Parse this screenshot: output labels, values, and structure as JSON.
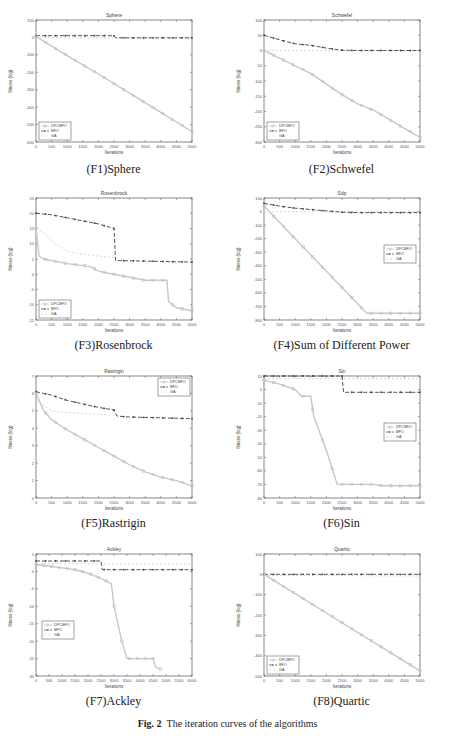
{
  "figure_caption": {
    "label": "Fig. 2",
    "text": "The iteration curves of the algorithms"
  },
  "legend_entries": [
    "DPCBFO",
    "BFO",
    "GA"
  ],
  "series_colors": {
    "DPCBFO": "#c8c8c8",
    "BFO": "#555555",
    "GA": "#d8d8d8"
  },
  "chart_data": [
    {
      "id": "F1",
      "caption": "(F1)Sphere",
      "type": "line",
      "title": "Sphere",
      "xlabel": "Iterations",
      "ylabel": "fitness (log)",
      "xlim": [
        0,
        5000
      ],
      "ylim": [
        -600,
        100
      ],
      "xticks": [
        0,
        500,
        1000,
        1500,
        2000,
        2500,
        3000,
        3500,
        4000,
        4500,
        5000
      ],
      "yticks": [
        -600,
        -500,
        -400,
        -300,
        -200,
        -100,
        0,
        100
      ],
      "legend_position": "lower-left",
      "series": [
        {
          "name": "DPCBFO",
          "x": [
            0,
            1000,
            2000,
            3000,
            4000,
            5000
          ],
          "values": [
            5,
            -105,
            -210,
            -320,
            -430,
            -540
          ]
        },
        {
          "name": "BFO",
          "x": [
            0,
            2500,
            2550,
            5000
          ],
          "values": [
            10,
            10,
            -2,
            -2
          ]
        },
        {
          "name": "GA",
          "x": [
            0,
            1000,
            2000,
            3000,
            4000,
            5000
          ],
          "values": [
            2,
            -2,
            -3,
            -4,
            -5,
            -6
          ]
        }
      ]
    },
    {
      "id": "F2",
      "caption": "(F2)Schwefel",
      "type": "line",
      "title": "Schwefel",
      "xlabel": "Iterations",
      "ylabel": "fitness (log)",
      "xlim": [
        0,
        5000
      ],
      "ylim": [
        -300,
        100
      ],
      "xticks": [
        0,
        500,
        1000,
        1500,
        2000,
        2500,
        3000,
        3500,
        4000,
        4500,
        5000
      ],
      "yticks": [
        -300,
        -250,
        -200,
        -150,
        -100,
        -50,
        0,
        50,
        100
      ],
      "legend_position": "lower-left",
      "series": [
        {
          "name": "DPCBFO",
          "x": [
            0,
            500,
            1000,
            1500,
            2000,
            2500,
            3000,
            3500,
            4000,
            4500,
            5000
          ],
          "values": [
            0,
            -25,
            -50,
            -75,
            -110,
            -145,
            -175,
            -195,
            -225,
            -255,
            -285
          ]
        },
        {
          "name": "BFO",
          "x": [
            0,
            500,
            1000,
            1500,
            2000,
            2500,
            3000,
            5000
          ],
          "values": [
            50,
            35,
            22,
            17,
            8,
            1,
            0,
            0
          ]
        },
        {
          "name": "GA",
          "x": [
            0,
            5000
          ],
          "values": [
            0,
            0
          ]
        }
      ]
    },
    {
      "id": "F3",
      "caption": "(F3)Rosenbrock",
      "type": "line",
      "title": "Rosenbrock",
      "xlabel": "Iterations",
      "ylabel": "fitness (log)",
      "xlim": [
        0,
        5000
      ],
      "ylim": [
        -15,
        25
      ],
      "xticks": [
        0,
        500,
        1000,
        1500,
        2000,
        2500,
        3000,
        3500,
        4000,
        4500,
        5000
      ],
      "yticks": [
        -15,
        -10,
        -5,
        0,
        5,
        10,
        15,
        20,
        25
      ],
      "legend_position": "lower-left",
      "series": [
        {
          "name": "DPCBFO",
          "x": [
            0,
            100,
            250,
            1000,
            1750,
            2000,
            2500,
            3000,
            3500,
            4200,
            4250,
            4500,
            5000
          ],
          "values": [
            15,
            6,
            5,
            3.5,
            2.5,
            1,
            0,
            -1,
            -2,
            -2,
            -9,
            -11,
            -12
          ]
        },
        {
          "name": "BFO",
          "x": [
            0,
            500,
            1000,
            1500,
            2000,
            2500,
            2550,
            5000
          ],
          "values": [
            20,
            19.5,
            18.5,
            17.5,
            16.5,
            15,
            4.5,
            4
          ]
        },
        {
          "name": "GA",
          "x": [
            0,
            250,
            500,
            1000,
            1500,
            2000,
            2500
          ],
          "values": [
            15,
            13.5,
            11,
            7.5,
            6.5,
            6,
            5.5
          ]
        }
      ]
    },
    {
      "id": "F4",
      "caption": "(F4)Sum of Different Power",
      "type": "line",
      "title": "Sdp",
      "xlabel": "Iterations",
      "ylabel": "fitness (log)",
      "xlim": [
        0,
        5000
      ],
      "ylim": [
        -800,
        100
      ],
      "xticks": [
        0,
        500,
        1000,
        1500,
        2000,
        2500,
        3000,
        3500,
        4000,
        4500,
        5000
      ],
      "yticks": [
        -800,
        -700,
        -600,
        -500,
        -400,
        -300,
        -200,
        -100,
        0,
        100
      ],
      "legend_position": "center-right",
      "series": [
        {
          "name": "DPCBFO",
          "x": [
            0,
            1000,
            2000,
            3000,
            3300,
            5000
          ],
          "values": [
            40,
            -200,
            -440,
            -680,
            -750,
            -750
          ]
        },
        {
          "name": "BFO",
          "x": [
            0,
            500,
            1000,
            1500,
            2000,
            2500,
            3000,
            5000
          ],
          "values": [
            60,
            40,
            25,
            15,
            5,
            -5,
            -8,
            -8
          ]
        },
        {
          "name": "GA",
          "x": [
            0,
            5000
          ],
          "values": [
            0,
            -2
          ]
        }
      ]
    },
    {
      "id": "F5",
      "caption": "(F5)Rastrigin",
      "type": "line",
      "title": "Rastrigin",
      "xlabel": "Iterations",
      "ylabel": "fitness (log)",
      "xlim": [
        0,
        5000
      ],
      "ylim": [
        0,
        7
      ],
      "xticks": [
        0,
        500,
        1000,
        1500,
        2000,
        2500,
        3000,
        3500,
        4000,
        4500,
        5000
      ],
      "yticks": [
        0,
        1,
        2,
        3,
        4,
        5,
        6,
        7
      ],
      "legend_position": "upper-right",
      "series": [
        {
          "name": "DPCBFO",
          "x": [
            0,
            250,
            500,
            1000,
            1500,
            2000,
            2500,
            3000,
            3500,
            4000,
            4500,
            5000
          ],
          "values": [
            6,
            5,
            4.5,
            3.9,
            3.4,
            2.9,
            2.4,
            1.9,
            1.5,
            1.2,
            1.0,
            0.7
          ]
        },
        {
          "name": "BFO",
          "x": [
            0,
            500,
            1000,
            1500,
            2000,
            2500,
            2600,
            3000,
            4000,
            5000
          ],
          "values": [
            6.1,
            5.9,
            5.6,
            5.4,
            5.2,
            5.05,
            4.7,
            4.65,
            4.6,
            4.55
          ]
        },
        {
          "name": "GA",
          "x": [
            0,
            500,
            1000,
            1500,
            2000,
            2500
          ],
          "values": [
            5.6,
            5.0,
            4.9,
            4.85,
            4.8,
            4.75
          ]
        }
      ]
    },
    {
      "id": "F6",
      "caption": "(F6)Sin",
      "type": "line",
      "title": "Sin",
      "xlabel": "Iterations",
      "ylabel": "fitness (log)",
      "xlim": [
        0,
        5000
      ],
      "ylim": [
        -80,
        10
      ],
      "xticks": [
        0,
        500,
        1000,
        1500,
        2000,
        2500,
        3000,
        3500,
        4000,
        4500,
        5000
      ],
      "yticks": [
        -80,
        -70,
        -60,
        -50,
        -40,
        -30,
        -20,
        -10,
        0,
        10
      ],
      "legend_position": "center-right",
      "series": [
        {
          "name": "DPCBFO",
          "x": [
            0,
            500,
            1000,
            1200,
            1500,
            1600,
            2000,
            2350,
            2500,
            3500,
            3800,
            5000
          ],
          "values": [
            7,
            4,
            0,
            -5,
            -5,
            -20,
            -45,
            -70,
            -70,
            -70,
            -71,
            -71
          ]
        },
        {
          "name": "BFO",
          "x": [
            0,
            2500,
            2550,
            5000
          ],
          "values": [
            10,
            10,
            -2,
            -2
          ]
        },
        {
          "name": "GA",
          "x": [
            0,
            5000
          ],
          "values": [
            8,
            8
          ]
        }
      ]
    },
    {
      "id": "F7",
      "caption": "(F7)Ackley",
      "type": "line",
      "title": "Ackley",
      "xlabel": "Iterations",
      "ylabel": "fitness (log)",
      "xlim": [
        0,
        6000
      ],
      "ylim": [
        -30,
        5
      ],
      "xticks": [
        0,
        500,
        1000,
        1500,
        2000,
        2500,
        3000,
        3500,
        4000,
        4500,
        5000,
        5500,
        6000
      ],
      "yticks": [
        -30,
        -25,
        -20,
        -15,
        -10,
        -5,
        0,
        5
      ],
      "legend_position": "center-left",
      "series": [
        {
          "name": "DPCBFO",
          "x": [
            0,
            500,
            1000,
            1500,
            2000,
            2500,
            2900,
            3000,
            3300,
            3500,
            4500,
            4600,
            4800
          ],
          "values": [
            2,
            1.5,
            1,
            0.5,
            -0.5,
            -2,
            -3.5,
            -10,
            -20,
            -25,
            -25,
            -27.5,
            -28
          ]
        },
        {
          "name": "BFO",
          "x": [
            0,
            2500,
            2550,
            6000
          ],
          "values": [
            3,
            3,
            0.5,
            0.5
          ]
        },
        {
          "name": "GA",
          "x": [
            0,
            6000
          ],
          "values": [
            2.2,
            2.2
          ]
        }
      ]
    },
    {
      "id": "F8",
      "caption": "(F8)Quartic",
      "type": "line",
      "title": "Quartic",
      "xlabel": "Iterations",
      "ylabel": "fitness (log)",
      "xlim": [
        0,
        5000
      ],
      "ylim": [
        -500,
        100
      ],
      "xticks": [
        0,
        500,
        1000,
        1500,
        2000,
        2500,
        3000,
        3500,
        4000,
        4500,
        5000
      ],
      "yticks": [
        -500,
        -400,
        -300,
        -200,
        -100,
        0,
        100
      ],
      "legend_position": "lower-left",
      "series": [
        {
          "name": "DPCBFO",
          "x": [
            0,
            1000,
            2000,
            3000,
            4000,
            5000
          ],
          "values": [
            0,
            -95,
            -190,
            -285,
            -380,
            -475
          ]
        },
        {
          "name": "BFO",
          "x": [
            0,
            5000
          ],
          "values": [
            0,
            0
          ]
        },
        {
          "name": "GA",
          "x": [
            0,
            5000
          ],
          "values": [
            -5,
            -8
          ]
        }
      ]
    }
  ]
}
